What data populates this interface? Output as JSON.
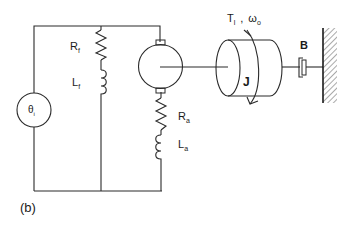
{
  "diagram": {
    "caption": "(b)",
    "source": {
      "label": "θ",
      "subscript": "i"
    },
    "field_resistor": {
      "label": "R",
      "subscript": "f"
    },
    "field_inductor": {
      "label": "L",
      "subscript": "f"
    },
    "armature_resistor": {
      "label": "R",
      "subscript": "a"
    },
    "armature_inductor": {
      "label": "L",
      "subscript": "a"
    },
    "inertia": {
      "label": "J"
    },
    "damper": {
      "label": "B"
    },
    "load": {
      "torque": "T",
      "torque_sub": "l",
      "separator": ",",
      "speed": "ω",
      "speed_sub": "o"
    }
  }
}
